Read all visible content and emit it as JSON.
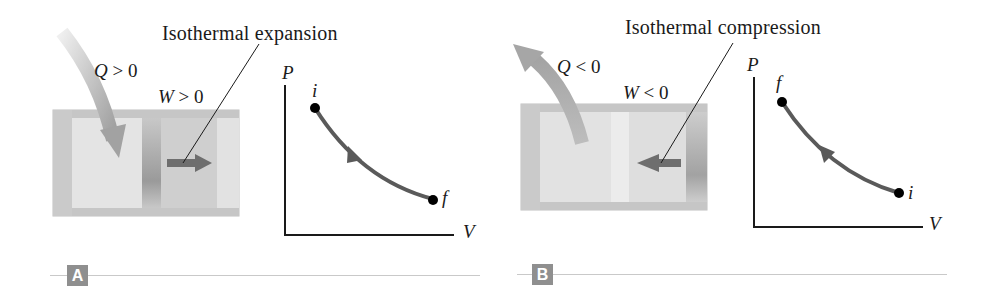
{
  "panels": [
    {
      "id": "A",
      "badge": "A",
      "title": "Isothermal expansion",
      "heat_label": {
        "var": "Q",
        "op": ">",
        "val": "0"
      },
      "work_label": {
        "var": "W",
        "op": ">",
        "val": "0"
      },
      "heat_direction": "into-cylinder",
      "piston_arrow_direction": "right",
      "graph": {
        "y_axis": "P",
        "x_axis": "V",
        "start_point": "i",
        "end_point": "f",
        "process_direction": "down-right"
      }
    },
    {
      "id": "B",
      "badge": "B",
      "title": "Isothermal compression",
      "heat_label": {
        "var": "Q",
        "op": "<",
        "val": "0"
      },
      "work_label": {
        "var": "W",
        "op": "<",
        "val": "0"
      },
      "heat_direction": "out-of-cylinder",
      "piston_arrow_direction": "left",
      "graph": {
        "y_axis": "P",
        "x_axis": "V",
        "start_point": "i",
        "end_point": "f",
        "process_direction": "up-left"
      }
    }
  ],
  "colors": {
    "curve": "#5a5a5a",
    "point": "#000000",
    "cylinder_body": "#dcdcdc",
    "cylinder_wall": "#c4c4c4",
    "heat_arrow": "#a8a8a8",
    "piston_arrow": "#6e6e6e",
    "badge_bg": "#8f8f8f",
    "rule": "#c9c9c9"
  }
}
